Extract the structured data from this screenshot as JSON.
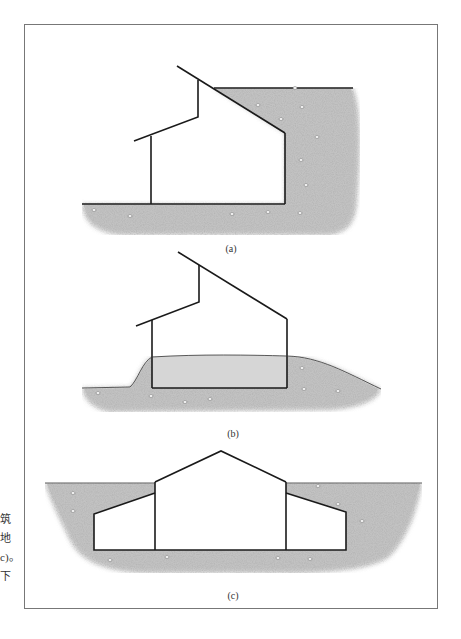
{
  "side_text": [
    "筑",
    "地",
    "c)。",
    "下"
  ],
  "figures": [
    {
      "id": "a",
      "caption": "(a)",
      "description": "House built into hillside with earth on rear wall and roof line"
    },
    {
      "id": "b",
      "caption": "(b)",
      "description": "House with earth berm around lower walls"
    },
    {
      "id": "c",
      "caption": "(c)",
      "description": "Sunken house with center gable and side wings below grade"
    }
  ],
  "colors": {
    "line": "#1a1a1a",
    "earth": "#c9c9c9",
    "earth_dark": "#b5b5b5",
    "interior_fill": "#d4d4d4",
    "frame": "#777777"
  }
}
